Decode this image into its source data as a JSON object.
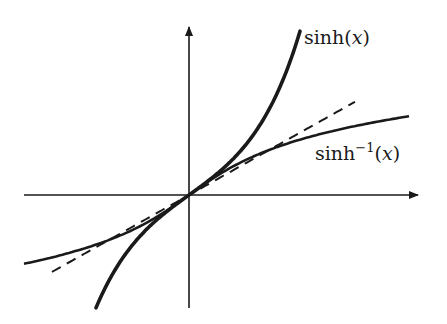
{
  "chart_data": {
    "type": "line",
    "title": "",
    "xlabel": "",
    "ylabel": "",
    "grid": false,
    "axes": {
      "x_arrow": true,
      "y_arrow": true,
      "ticks": false
    },
    "xlim": [
      -3.3,
      4.6
    ],
    "ylim": [
      -3.3,
      4.6
    ],
    "series": [
      {
        "name": "sinh(x)",
        "function": "sinh",
        "x_range": [
          -1.86,
          2.22
        ],
        "style": "solid-thick",
        "label_position": "top-right end"
      },
      {
        "name": "sinh^-1(x)",
        "function": "asinh",
        "x_range": [
          -3.3,
          4.4
        ],
        "style": "solid",
        "label_position": "right end, below curve"
      },
      {
        "name": "y = x",
        "function": "identity",
        "x_range": [
          -2.74,
          3.32
        ],
        "style": "dashed"
      }
    ]
  },
  "labels": {
    "sinh": {
      "fn": "sinh",
      "open": "(",
      "var": "x",
      "close": ")"
    },
    "asinh": {
      "fn": "sinh",
      "sup": "−1",
      "open": "(",
      "var": "x",
      "close": ")"
    }
  }
}
